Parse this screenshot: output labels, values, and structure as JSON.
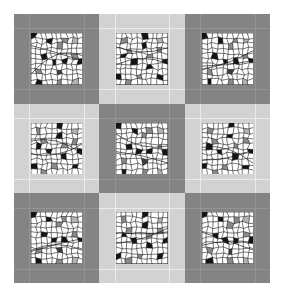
{
  "figure": {
    "name": "quilt-tile-montage",
    "layout": {
      "rows": 3,
      "cols": 3,
      "tile_count": 9
    },
    "background_color": "#ffffff",
    "frame_colors": {
      "dark": "#848484",
      "light": "#d2d2d2"
    },
    "patch_colors": {
      "cell_background": "#ffffff",
      "mesh_line": "#1a1a1a",
      "fill_black": "#141414",
      "fill_dark_gray": "#3c3c3c",
      "fill_mid_gray": "#8a8a8a",
      "fill_light_gray": "#b4b4b4"
    },
    "tiles": [
      {
        "index": 0,
        "row": 0,
        "col": 0,
        "frame": "dark",
        "pattern": "A"
      },
      {
        "index": 1,
        "row": 0,
        "col": 1,
        "frame": "light",
        "pattern": "B"
      },
      {
        "index": 2,
        "row": 0,
        "col": 2,
        "frame": "dark",
        "pattern": "A"
      },
      {
        "index": 3,
        "row": 1,
        "col": 0,
        "frame": "light",
        "pattern": "B"
      },
      {
        "index": 4,
        "row": 1,
        "col": 1,
        "frame": "dark",
        "pattern": "A"
      },
      {
        "index": 5,
        "row": 1,
        "col": 2,
        "frame": "light",
        "pattern": "B"
      },
      {
        "index": 6,
        "row": 2,
        "col": 0,
        "frame": "dark",
        "pattern": "A"
      },
      {
        "index": 7,
        "row": 2,
        "col": 1,
        "frame": "light",
        "pattern": "B"
      },
      {
        "index": 8,
        "row": 2,
        "col": 2,
        "frame": "dark",
        "pattern": "A"
      }
    ],
    "patterns": {
      "A": {
        "name": "irregular-mesh-a",
        "grid": {
          "cols": 10,
          "rows": 10
        },
        "filled_cells": [
          {
            "col": 0,
            "row": 0,
            "shade": "fill_black"
          },
          {
            "col": 3,
            "row": 1,
            "shade": "fill_black"
          },
          {
            "col": 6,
            "row": 1,
            "shade": "fill_mid_gray"
          },
          {
            "col": 8,
            "row": 1,
            "shade": "fill_light_gray"
          },
          {
            "col": 5,
            "row": 2,
            "shade": "fill_mid_gray"
          },
          {
            "col": 2,
            "row": 4,
            "shade": "fill_black"
          },
          {
            "col": 8,
            "row": 4,
            "shade": "fill_mid_gray"
          },
          {
            "col": 4,
            "row": 5,
            "shade": "fill_black"
          },
          {
            "col": 6,
            "row": 5,
            "shade": "fill_black"
          },
          {
            "col": 9,
            "row": 5,
            "shade": "fill_black"
          },
          {
            "col": 1,
            "row": 7,
            "shade": "fill_mid_gray"
          },
          {
            "col": 5,
            "row": 7,
            "shade": "fill_dark_gray"
          },
          {
            "col": 1,
            "row": 9,
            "shade": "fill_black"
          },
          {
            "col": 5,
            "row": 9,
            "shade": "fill_mid_gray"
          },
          {
            "col": 8,
            "row": 9,
            "shade": "fill_light_gray"
          }
        ]
      },
      "B": {
        "name": "irregular-mesh-b",
        "grid": {
          "cols": 10,
          "rows": 10
        },
        "filled_cells": [
          {
            "col": 5,
            "row": 0,
            "shade": "fill_black"
          },
          {
            "col": 1,
            "row": 1,
            "shade": "fill_mid_gray"
          },
          {
            "col": 8,
            "row": 1,
            "shade": "fill_light_gray"
          },
          {
            "col": 5,
            "row": 2,
            "shade": "fill_black"
          },
          {
            "col": 8,
            "row": 3,
            "shade": "fill_mid_gray"
          },
          {
            "col": 2,
            "row": 3,
            "shade": "fill_mid_gray"
          },
          {
            "col": 1,
            "row": 4,
            "shade": "fill_black"
          },
          {
            "col": 6,
            "row": 4,
            "shade": "fill_mid_gray"
          },
          {
            "col": 3,
            "row": 5,
            "shade": "fill_black"
          },
          {
            "col": 9,
            "row": 5,
            "shade": "fill_black"
          },
          {
            "col": 6,
            "row": 6,
            "shade": "fill_black"
          },
          {
            "col": 0,
            "row": 8,
            "shade": "fill_black"
          },
          {
            "col": 4,
            "row": 8,
            "shade": "fill_mid_gray"
          },
          {
            "col": 8,
            "row": 8,
            "shade": "fill_black"
          },
          {
            "col": 2,
            "row": 9,
            "shade": "fill_mid_gray"
          }
        ]
      }
    }
  }
}
